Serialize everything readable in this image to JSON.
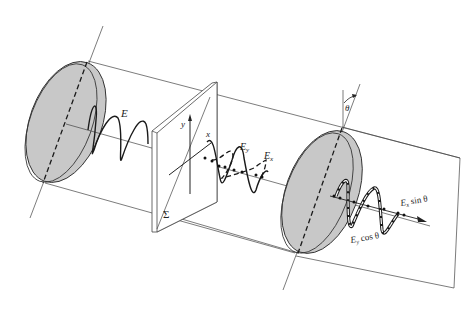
{
  "figure": {
    "colors": {
      "disk_fill": "#c8c8c8",
      "line": "#444444",
      "wave": "#1a1a1a",
      "background": "#ffffff"
    },
    "labels": {
      "incident_field": "E",
      "plate": "Σ",
      "axis_y": "y",
      "axis_x": "x",
      "component_y": "E",
      "component_y_sub": "y",
      "component_x": "E",
      "component_x_sub": "x",
      "angle": "θ",
      "out_x": "E",
      "out_x_sub": "x",
      "out_x_rest": " sin θ",
      "out_y": "E",
      "out_y_sub": "y",
      "out_y_rest": " cos θ"
    }
  }
}
